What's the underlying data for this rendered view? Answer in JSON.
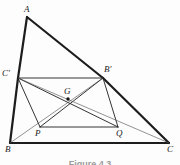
{
  "figure": {
    "caption": "Figure 4.3",
    "width": 180,
    "height": 165,
    "background": "#fdfdfd",
    "stroke_dark": "#1d1d1d",
    "stroke_thin": "#4a4a4a",
    "point_fill": "#111111"
  },
  "points": {
    "A": {
      "label": "A",
      "x": 27,
      "y": 17,
      "lx": 24,
      "ly": 5,
      "dot": false
    },
    "B": {
      "label": "B",
      "x": 10,
      "y": 143,
      "lx": 5,
      "ly": 145,
      "dot": false
    },
    "C": {
      "label": "C",
      "x": 169,
      "y": 143,
      "lx": 167,
      "ly": 145,
      "dot": false
    },
    "Cp": {
      "label": "C'",
      "x": 18,
      "y": 78,
      "lx": 2,
      "ly": 69,
      "dot": false
    },
    "Bp": {
      "label": "B'",
      "x": 103,
      "y": 78,
      "lx": 104,
      "ly": 65,
      "dot": false
    },
    "P": {
      "label": "P",
      "x": 40,
      "y": 127,
      "lx": 35,
      "ly": 129,
      "dot": false
    },
    "Q": {
      "label": "Q",
      "x": 118,
      "y": 127,
      "lx": 116,
      "ly": 129,
      "dot": false
    },
    "G": {
      "label": "G",
      "x": 68,
      "y": 99,
      "lx": 64,
      "ly": 87,
      "dot": true
    }
  },
  "segments": [
    {
      "name": "side-AB",
      "from": "A",
      "to": "Cp",
      "weight": "thick"
    },
    {
      "name": "side-CpB",
      "from": "Cp",
      "to": "B",
      "weight": "thick"
    },
    {
      "name": "side-AC",
      "from": "A",
      "to": "Bp",
      "weight": "thick"
    },
    {
      "name": "side-BpC",
      "from": "Bp",
      "to": "C",
      "weight": "thick"
    },
    {
      "name": "side-BC",
      "from": "B",
      "to": "C",
      "weight": "thick"
    },
    {
      "name": "midline-CpBp",
      "from": "Cp",
      "to": "Bp",
      "weight": "medium"
    },
    {
      "name": "segment-CpP",
      "from": "Cp",
      "to": "P",
      "weight": "medium"
    },
    {
      "name": "segment-BpQ",
      "from": "Bp",
      "to": "Q",
      "weight": "medium"
    },
    {
      "name": "segment-PQ",
      "from": "P",
      "to": "Q",
      "weight": "medium"
    },
    {
      "name": "diagonal-CpQ",
      "from": "Cp",
      "to": "Q",
      "weight": "medium"
    },
    {
      "name": "diagonal-PBp",
      "from": "P",
      "to": "Bp",
      "weight": "medium"
    },
    {
      "name": "median-BBp",
      "from": "B",
      "to": "Bp",
      "weight": "thin"
    },
    {
      "name": "median-CCp",
      "from": "C",
      "to": "Cp",
      "weight": "thin"
    }
  ],
  "stroke_widths": {
    "thick": 2.2,
    "medium": 0.9,
    "thin": 0.6
  }
}
